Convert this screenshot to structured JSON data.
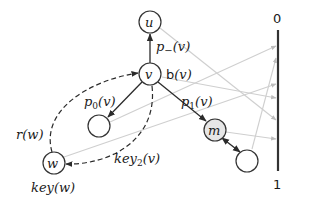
{
  "diagram": {
    "nodes": {
      "u": {
        "label": "u"
      },
      "v": {
        "label": "v",
        "annotation": "b(v)"
      },
      "left_empty": {
        "label": ""
      },
      "m": {
        "label": "m",
        "fill": "#e6e6e6"
      },
      "bottom_right_empty": {
        "label": ""
      },
      "w": {
        "label": "w",
        "annotation": "key(w)"
      }
    },
    "edge_labels": {
      "v_to_u": "p_(v)",
      "v_to_left": "p0(v)",
      "v_to_m": "p1(v)",
      "w_to_v_dashed": "r(w)",
      "v_to_w_dashed": "key2(v)"
    },
    "label_parts": {
      "p_minus": {
        "base": "p",
        "sub": "−",
        "arg": "(v)"
      },
      "p0": {
        "base": "p",
        "sub": "0",
        "arg": "(v)"
      },
      "p1": {
        "base": "p",
        "sub": "1",
        "arg": "(v)"
      },
      "r": {
        "text": "r(w)"
      },
      "key2": {
        "base": "key",
        "sub": "2",
        "arg": "(v)"
      },
      "keyw": {
        "text": "key(w)"
      },
      "bv": {
        "b": "b",
        "arg": "(v)"
      }
    },
    "axis": {
      "top_label": "0",
      "bottom_label": "1"
    },
    "colors": {
      "edge": "#2b2b2b",
      "gray_mapping_line": "#cfcfcf",
      "m_fill": "#e6e6e6"
    }
  }
}
